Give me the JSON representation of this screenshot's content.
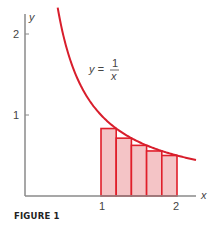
{
  "figure": {
    "caption": "FIGURE 1",
    "function_label": {
      "lhs": "y =",
      "numerator": "1",
      "denominator": "x"
    },
    "axis_labels": {
      "x": "x",
      "y": "y"
    },
    "x_ticks": [
      "1",
      "2"
    ],
    "y_ticks": [
      "1",
      "2"
    ],
    "colors": {
      "curve": "#d81e2c",
      "rect_fill": "#f4c4c6",
      "rect_stroke": "#e01e2a",
      "axis": "#8a8a8a",
      "text": "#444444"
    }
  },
  "chart_data": {
    "type": "line",
    "title": "",
    "xlabel": "x",
    "ylabel": "y",
    "xlim": [
      0,
      2.25
    ],
    "ylim": [
      0,
      2.2
    ],
    "grid": false,
    "series": [
      {
        "name": "y = 1/x",
        "kind": "curve",
        "x_range": [
          0.43,
          2.25
        ],
        "formula": "1/x"
      },
      {
        "name": "lower-sum rectangles (right endpoints)",
        "kind": "bar",
        "x_left": [
          1.0,
          1.2,
          1.4,
          1.6,
          1.8
        ],
        "width": 0.2,
        "values": [
          0.833,
          0.714,
          0.625,
          0.556,
          0.5
        ]
      }
    ],
    "x_ticks": [
      1,
      2
    ],
    "y_ticks": [
      1,
      2
    ],
    "annotations": [
      "y = 1/x"
    ],
    "caption": "FIGURE 1"
  }
}
